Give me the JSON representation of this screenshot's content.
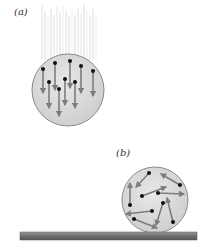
{
  "figure": {
    "panel_a": {
      "label": "(a)",
      "description": "sphere falling with all molecules moving downward (ordered motion)",
      "circle": {
        "cx": 68,
        "cy": 90,
        "r": 36,
        "fill": "#d9d9d9",
        "stroke": "#8a8a8a"
      },
      "arrows": [
        {
          "x1": 43,
          "y1": 69,
          "x2": 43,
          "y2": 93
        },
        {
          "x1": 55,
          "y1": 63,
          "x2": 55,
          "y2": 90
        },
        {
          "x1": 70,
          "y1": 61,
          "x2": 70,
          "y2": 88
        },
        {
          "x1": 81,
          "y1": 66,
          "x2": 81,
          "y2": 93
        },
        {
          "x1": 93,
          "y1": 71,
          "x2": 93,
          "y2": 96
        },
        {
          "x1": 49,
          "y1": 82,
          "x2": 49,
          "y2": 108
        },
        {
          "x1": 59,
          "y1": 89,
          "x2": 59,
          "y2": 116
        },
        {
          "x1": 65,
          "y1": 79,
          "x2": 65,
          "y2": 105
        },
        {
          "x1": 75,
          "y1": 82,
          "x2": 75,
          "y2": 108
        }
      ],
      "streaks": {
        "x_start": 42,
        "x_end": 96,
        "y_top": 5,
        "y_bottom": 60,
        "color": "#e6e6e6"
      }
    },
    "panel_b": {
      "label": "(b)",
      "description": "sphere at rest on a surface with molecules moving randomly (disordered motion)",
      "circle": {
        "cx": 155,
        "cy": 200,
        "r": 33,
        "fill": "#d9d9d9",
        "stroke": "#8a8a8a"
      },
      "arrows": [
        {
          "x1": 149,
          "y1": 173,
          "x2": 136,
          "y2": 187
        },
        {
          "x1": 180,
          "y1": 185,
          "x2": 161,
          "y2": 174
        },
        {
          "x1": 142,
          "y1": 196,
          "x2": 166,
          "y2": 187
        },
        {
          "x1": 158,
          "y1": 193,
          "x2": 184,
          "y2": 194
        },
        {
          "x1": 130,
          "y1": 205,
          "x2": 130,
          "y2": 183
        },
        {
          "x1": 152,
          "y1": 211,
          "x2": 126,
          "y2": 214
        },
        {
          "x1": 163,
          "y1": 203,
          "x2": 156,
          "y2": 225
        },
        {
          "x1": 173,
          "y1": 222,
          "x2": 167,
          "y2": 198
        },
        {
          "x1": 134,
          "y1": 219,
          "x2": 157,
          "y2": 228
        }
      ]
    },
    "surface": {
      "x": 20,
      "y": 232,
      "width": 177,
      "height": 8,
      "color": "#7a7a7a"
    },
    "colors": {
      "arrow": "#7d7d7d",
      "dot": "#111111"
    }
  }
}
